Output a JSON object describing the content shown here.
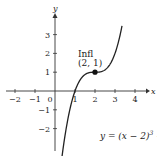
{
  "chart_data": {
    "type": "line",
    "title": "",
    "xlabel": "x",
    "ylabel": "y",
    "xlim": [
      -2.6,
      4.9
    ],
    "ylim": [
      -2.9,
      4.0
    ],
    "x_ticks": [
      -2,
      -1,
      1,
      2,
      3,
      4
    ],
    "x_tick_labels": [
      "−2",
      "−1",
      "1",
      "2",
      "3",
      "4"
    ],
    "y_ticks": [
      3,
      2,
      1,
      -1,
      -2
    ],
    "y_tick_labels": [
      "3",
      "2",
      "1",
      "−1",
      "−2"
    ],
    "origin_label": "0",
    "grid": false,
    "series": [
      {
        "name": "y = (x − 2)^3 + 1",
        "function": "(x-2)^3+1",
        "x_range": [
          0.35,
          3.35
        ],
        "color": "#222222"
      }
    ],
    "points": [
      {
        "x": 2,
        "y": 1,
        "label_line1": "Infl",
        "label_line2": "(2, 1)"
      }
    ],
    "equation_label": {
      "prefix": "y = (x − 2)",
      "exponent": "3",
      "suffix": " + 1"
    }
  }
}
